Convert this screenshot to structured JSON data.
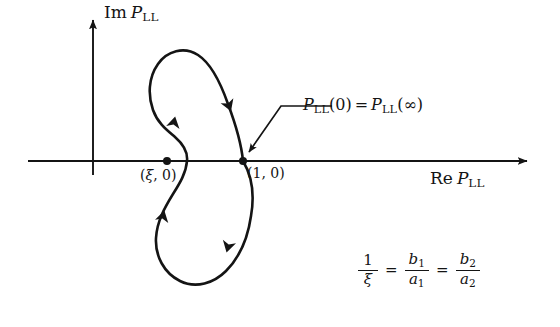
{
  "figure": {
    "type": "nyquist-plot",
    "background": "#ffffff",
    "ink_color": "#141414",
    "width": 560,
    "height": 327
  },
  "axes": {
    "vertical": {
      "label_rm": "Im",
      "label_it": "P",
      "label_sub": "LL",
      "x": 93,
      "top": 20,
      "bottom": 175
    },
    "horizontal": {
      "label_rm": "Re",
      "label_it": "P",
      "label_sub": "LL",
      "y": 161,
      "left": 28,
      "right": 527
    },
    "origin": {
      "x": 93,
      "y": 161
    }
  },
  "points": [
    {
      "name": "xi-point",
      "label_open": "(",
      "label_sym": "ξ",
      "label_rest": ", 0)",
      "x": 167,
      "y": 161,
      "label_x": 140,
      "label_y": 168
    },
    {
      "name": "one-zero-point",
      "label_open": "(",
      "label_sym": "1",
      "label_rest": ", 0)",
      "x": 243,
      "y": 161,
      "label_x": 247,
      "label_y": 166
    }
  ],
  "callout": {
    "text_it1": "P",
    "text_sub1": "LL",
    "text_arg1": "(0)",
    "text_eq": "=",
    "text_it2": "P",
    "text_sub2": "LL",
    "text_arg2": "(∞)",
    "text_x": 303,
    "text_y": 97,
    "leader_path": "M 332 106 L 281 106 L 249 152",
    "arrow_tip_x": 246,
    "arrow_tip_y": 158
  },
  "curve": {
    "name": "kidney-contour",
    "description": "closed kidney-shaped Nyquist contour through (1,0)",
    "stroke_width": 2.6,
    "path": "M 243 161 C 241 140 234 120 228 104 C 221 84 212 64 198 55 C 184 46 167 51 158 64 C 148 78 148 96 153 110 C 158 124 168 131 175 137 C 183 144 188 152 187 161 C 186 173 180 183 173 194 C 165 207 157 221 156 238 C 155 256 164 273 180 281 C 196 289 214 283 226 271 C 240 257 248 237 251 216 C 255 193 252 176 243 161 Z",
    "arrows": [
      {
        "name": "arrow-upper-right",
        "x": 229,
        "y": 106,
        "angle": 69
      },
      {
        "name": "arrow-left-up",
        "x": 174,
        "y": 122,
        "angle": -78
      },
      {
        "name": "arrow-lower-left-up",
        "x": 163,
        "y": 216,
        "angle": -76
      },
      {
        "name": "arrow-bottom-right-down",
        "x": 228,
        "y": 247,
        "angle": 105
      }
    ]
  },
  "formula": {
    "lhs_num": "1",
    "lhs_den": "ξ",
    "eq1": "=",
    "mid_num": "b",
    "mid_num_sub": "1",
    "mid_den": "a",
    "mid_den_sub": "1",
    "eq2": "=",
    "rhs_num": "b",
    "rhs_num_sub": "2",
    "rhs_den": "a",
    "rhs_den_sub": "2",
    "x": 358,
    "y": 252
  }
}
